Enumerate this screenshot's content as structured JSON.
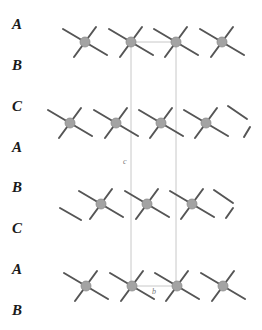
{
  "diagram": {
    "title": "",
    "stacking_labels": [
      {
        "text": "A",
        "x": 12,
        "y": 17
      },
      {
        "text": "B",
        "x": 12,
        "y": 58
      },
      {
        "text": "C",
        "x": 12,
        "y": 99
      },
      {
        "text": "A",
        "x": 12,
        "y": 140
      },
      {
        "text": "B",
        "x": 12,
        "y": 180
      },
      {
        "text": "C",
        "x": 12,
        "y": 221
      },
      {
        "text": "A",
        "x": 12,
        "y": 262
      },
      {
        "text": "B",
        "x": 12,
        "y": 303
      }
    ],
    "axis_labels": [
      {
        "text": "c",
        "x": 123,
        "y": 158
      },
      {
        "text": "b",
        "x": 152,
        "y": 288
      }
    ],
    "atom_rows": [
      {
        "y": 42,
        "x": [
          85,
          131,
          176,
          222
        ]
      },
      {
        "y": 123,
        "x": [
          70,
          116,
          161,
          206
        ]
      },
      {
        "y": 204,
        "x": [
          101,
          147,
          192
        ]
      },
      {
        "y": 286,
        "x": [
          86,
          132,
          177,
          223
        ]
      }
    ],
    "partial_bonds": [
      {
        "x1": 228,
        "y1": 106,
        "x2": 247,
        "y2": 119
      },
      {
        "x1": 244,
        "y1": 137,
        "x2": 250,
        "y2": 127
      },
      {
        "x1": 60,
        "y1": 208,
        "x2": 81,
        "y2": 220
      },
      {
        "x1": 214,
        "y1": 190,
        "x2": 233,
        "y2": 203
      },
      {
        "x1": 226,
        "y1": 218,
        "x2": 233,
        "y2": 208
      }
    ],
    "unit_cell": {
      "left_x": 131,
      "right_x": 176,
      "top_y": 42,
      "bottom_y": 286
    },
    "colors": {
      "atom_fill": "#a3a3a3",
      "atom_stroke": "#8a8a8a",
      "bond": "#555555",
      "cell_line": "#c8c8c8",
      "label": "#1a1a1a"
    }
  }
}
